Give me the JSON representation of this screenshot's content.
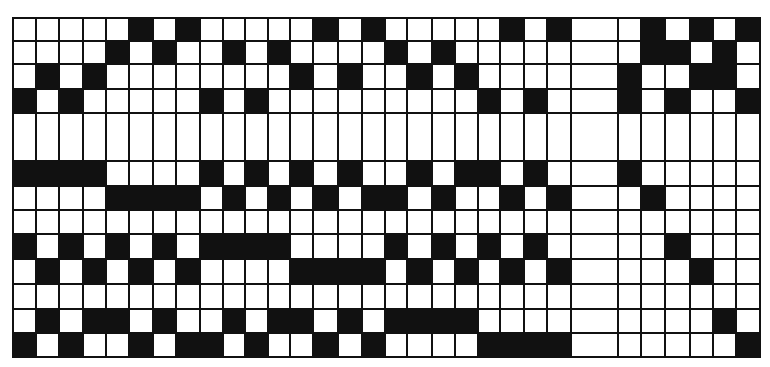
{
  "grid": {
    "description": "Binary punch-card style grid pattern",
    "colors": {
      "filled": "#111111",
      "empty": "#ffffff",
      "line": "#111111"
    },
    "column_widths": [
      23,
      23,
      24,
      23,
      23,
      24,
      23,
      24,
      23,
      22,
      23,
      22,
      23,
      25,
      24,
      23,
      22,
      25,
      23,
      23,
      22,
      24,
      23,
      24,
      47,
      23,
      24,
      25,
      23,
      23,
      24
    ],
    "row_heights": [
      23,
      23,
      25,
      24,
      48,
      25,
      24,
      24,
      25,
      25,
      25,
      24,
      24
    ],
    "rows": [
      [
        5,
        7,
        13,
        15,
        21,
        23,
        26,
        28,
        30
      ],
      [
        4,
        6,
        9,
        11,
        16,
        18,
        26,
        27,
        29
      ],
      [
        1,
        3,
        12,
        14,
        17,
        19,
        25,
        28,
        29
      ],
      [
        0,
        2,
        8,
        10,
        20,
        22,
        25,
        27,
        30
      ],
      [],
      [
        0,
        1,
        2,
        3,
        8,
        10,
        12,
        14,
        17,
        19,
        20,
        22,
        25
      ],
      [
        4,
        5,
        6,
        7,
        9,
        11,
        13,
        15,
        16,
        18,
        21,
        23,
        26
      ],
      [],
      [
        0,
        2,
        4,
        6,
        8,
        9,
        10,
        11,
        16,
        18,
        20,
        22,
        27
      ],
      [
        1,
        3,
        5,
        7,
        12,
        13,
        14,
        15,
        17,
        19,
        21,
        23,
        28
      ],
      [],
      [
        1,
        3,
        4,
        6,
        9,
        11,
        12,
        14,
        16,
        17,
        18,
        19,
        29
      ],
      [
        0,
        2,
        5,
        7,
        8,
        10,
        13,
        15,
        20,
        21,
        22,
        23,
        30
      ]
    ]
  }
}
